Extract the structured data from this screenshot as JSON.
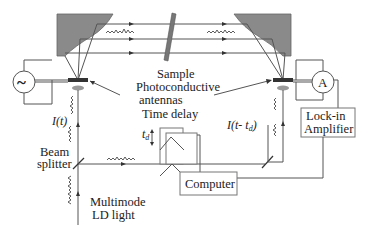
{
  "diagram": {
    "labels": {
      "sample": "Sample",
      "photoconductive": "Photoconductive",
      "antennas": "antennas",
      "time_delay": "Time delay",
      "td_symbol": "t",
      "td_sub": "d",
      "i_t": "I(t)",
      "i_t_td": "I(t- t",
      "i_t_td_sub": "d",
      "i_t_td_close": ")",
      "beam": "Beam",
      "splitter": "splitter",
      "multimode": "Multimode",
      "ld_light": "LD light",
      "computer": "Computer",
      "lock_in": "Lock-in",
      "amplifier": "Amplifier",
      "ac_source_symbol": "~",
      "ammeter_symbol": "A"
    },
    "components": [
      {
        "id": "ac-source",
        "label": "~"
      },
      {
        "id": "left-parabolic-mirror"
      },
      {
        "id": "right-parabolic-mirror"
      },
      {
        "id": "sample-slab",
        "label": "Sample"
      },
      {
        "id": "emitter-antenna",
        "label": "Photoconductive antennas"
      },
      {
        "id": "detector-antenna",
        "label": "Photoconductive antennas"
      },
      {
        "id": "ammeter",
        "label": "A"
      },
      {
        "id": "lock-in-amplifier",
        "label": "Lock-in Amplifier"
      },
      {
        "id": "time-delay-stage",
        "label": "Time delay"
      },
      {
        "id": "beam-splitter",
        "label": "Beam splitter"
      },
      {
        "id": "computer",
        "label": "Computer"
      },
      {
        "id": "ld-light-source",
        "label": "Multimode LD light"
      }
    ],
    "colors": {
      "mirror": "#8a8a8a",
      "line": "#555555",
      "text": "#222222",
      "background": "#ffffff"
    }
  }
}
